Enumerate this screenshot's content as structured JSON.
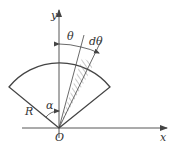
{
  "diagram": {
    "type": "geometry-sector",
    "colors": {
      "line": "#444444",
      "hatch": "#777777",
      "background": "#ffffff"
    },
    "labels": {
      "y_axis": "y",
      "x_axis": "x",
      "origin": "O",
      "radius": "R",
      "half_angle": "α",
      "theta": "θ",
      "dtheta": "dθ"
    }
  }
}
